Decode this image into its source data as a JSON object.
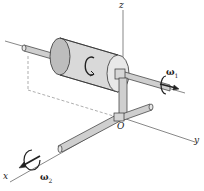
{
  "figure": {
    "type": "3D mechanics diagram",
    "labels": {
      "z_axis": "z",
      "y_axis": "y",
      "x_axis": "x",
      "origin": "O",
      "omega1_symbol": "ω",
      "omega1_sub": "1",
      "omega2_symbol": "ω",
      "omega2_sub": "2"
    },
    "colors": {
      "line": "#333333",
      "cylinder_fill": "#d9d9d9",
      "cylinder_shade": "#bdbdbd",
      "shaft_fill": "#cfcfcf",
      "axis": "#555555",
      "dashed": "#777777"
    }
  }
}
